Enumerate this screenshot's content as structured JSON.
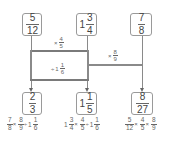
{
  "diagram": {
    "inputs": [
      {
        "whole": "",
        "num": "5",
        "den": "12"
      },
      {
        "whole": "1",
        "num": "3",
        "den": "4"
      },
      {
        "whole": "",
        "num": "7",
        "den": "8"
      }
    ],
    "operations": [
      {
        "symbol": "×",
        "whole": "",
        "num": "4",
        "den": "5"
      },
      {
        "symbol": "÷",
        "whole": "1",
        "num": "1",
        "den": "6"
      },
      {
        "symbol": "×",
        "whole": "",
        "num": "8",
        "den": "9"
      }
    ],
    "outputs": [
      {
        "whole": "",
        "num": "2",
        "den": "3"
      },
      {
        "whole": "1",
        "num": "1",
        "den": "5"
      },
      {
        "whole": "",
        "num": "8",
        "den": "27"
      }
    ],
    "expressions": [
      {
        "t1": {
          "whole": "",
          "num": "7",
          "den": "8"
        },
        "op1": "×",
        "t2": {
          "whole": "",
          "num": "8",
          "den": "9"
        },
        "op2": "÷",
        "t3": {
          "whole": "1",
          "num": "1",
          "den": "6"
        }
      },
      {
        "t1": {
          "whole": "1",
          "num": "3",
          "den": "4"
        },
        "op1": "×",
        "t2": {
          "whole": "",
          "num": "4",
          "den": "5"
        },
        "op2": "÷",
        "t3": {
          "whole": "1",
          "num": "1",
          "den": "6"
        }
      },
      {
        "t1": {
          "whole": "",
          "num": "5",
          "den": "12"
        },
        "op1": "×",
        "t2": {
          "whole": "",
          "num": "4",
          "den": "5"
        },
        "op2": "×",
        "t3": {
          "whole": "",
          "num": "8",
          "den": "9"
        }
      }
    ],
    "colors": {
      "line": "#8a8a8a",
      "box_border": "#9a9a9a",
      "text": "#555555"
    }
  }
}
